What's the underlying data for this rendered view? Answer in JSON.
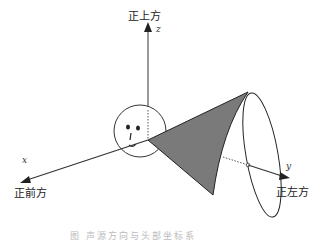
{
  "labels": {
    "up": "正上方",
    "front": "正前方",
    "left": "正左方"
  },
  "axes": {
    "x": "x",
    "y": "y",
    "z": "z"
  },
  "caption": "图  声源方向与头部坐标系"
}
